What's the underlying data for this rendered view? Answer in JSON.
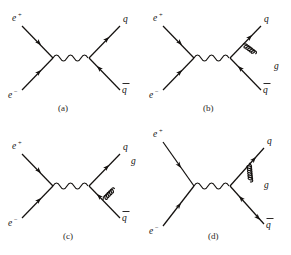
{
  "figure": {
    "background_color": "#ffffff",
    "line_color": "#14110f",
    "width": 291,
    "height": 255
  },
  "labels": {
    "positron": "e",
    "positron_charge": "+",
    "electron": "e",
    "electron_charge": "−",
    "quark": "q",
    "antiquark": "q",
    "gluon": "g"
  },
  "panels": [
    {
      "id": "a",
      "caption": "(a)",
      "process": "e+ e- -> gamma* -> q qbar",
      "has_gluon": false,
      "gluon_attachment": "none",
      "incoming": [
        "e+",
        "e-"
      ],
      "outgoing": [
        "q",
        "qbar"
      ],
      "propagator": "photon",
      "labels": {
        "top_left": "e",
        "top_left_sup": "+",
        "bottom_left": "e",
        "bottom_left_sup": "−",
        "top_right": "q",
        "bottom_right": "q"
      }
    },
    {
      "id": "b",
      "caption": "(b)",
      "process": "e+ e- -> gamma* -> q qbar g (gluon from quark)",
      "has_gluon": true,
      "gluon_attachment": "quark",
      "gluon_direction": "down-right",
      "incoming": [
        "e+",
        "e-"
      ],
      "outgoing": [
        "q",
        "qbar",
        "g"
      ],
      "propagator": "photon",
      "labels": {
        "top_left": "e",
        "top_left_sup": "+",
        "bottom_left": "e",
        "bottom_left_sup": "−",
        "top_right": "q",
        "bottom_right": "q",
        "gluon": "g"
      }
    },
    {
      "id": "c",
      "caption": "(c)",
      "process": "e+ e- -> gamma* -> q qbar g (gluon from antiquark)",
      "has_gluon": true,
      "gluon_attachment": "antiquark",
      "gluon_direction": "up-right",
      "incoming": [
        "e+",
        "e-"
      ],
      "outgoing": [
        "q",
        "qbar",
        "g"
      ],
      "propagator": "photon",
      "labels": {
        "top_left": "e",
        "top_left_sup": "+",
        "bottom_left": "e",
        "bottom_left_sup": "−",
        "top_right": "q",
        "bottom_right": "q",
        "gluon": "g"
      }
    },
    {
      "id": "d",
      "caption": "(d)",
      "process": "e+ e- -> gamma* -> q qbar with gluon vertex correction",
      "has_gluon": true,
      "gluon_attachment": "vertex-loop",
      "gluon_direction": "vertical",
      "incoming": [
        "e+",
        "e-"
      ],
      "outgoing": [
        "q",
        "qbar"
      ],
      "propagator": "photon",
      "labels": {
        "top_left": "e",
        "top_left_sup": "+",
        "bottom_left": "e",
        "bottom_left_sup": "−",
        "top_right": "q",
        "bottom_right": "q",
        "gluon": "g"
      }
    }
  ]
}
